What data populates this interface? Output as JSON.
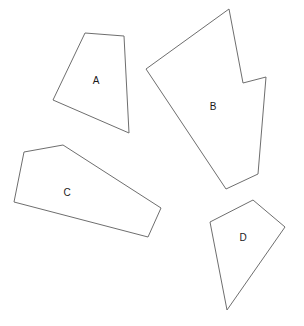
{
  "figure": {
    "kind": "polygon-diagram",
    "width": 304,
    "height": 326,
    "background_color": "#ffffff",
    "stroke_color": "#6e6e6e",
    "fill_color": "#ffffff",
    "label_color": "#1a1a1a",
    "stroke_width": 1
  },
  "chart_data": {
    "type": "table",
    "title": "",
    "xlabel": "",
    "ylabel": "",
    "shape_count": 4,
    "shapes": [
      {
        "label": "A",
        "vertex_count": 4,
        "kind": "quadrilateral",
        "convex": true,
        "points": "85,33 124,36 129,133 53,100",
        "label_x": 96,
        "label_y": 81
      },
      {
        "label": "B",
        "vertex_count": 6,
        "kind": "concave-hexagon",
        "convex": false,
        "points": "229,9 243,83 266,77 258,174 226,189 146,69",
        "label_x": 213,
        "label_y": 107
      },
      {
        "label": "C",
        "vertex_count": 5,
        "kind": "pentagon",
        "convex": true,
        "points": "24,152 63,145 161,208 148,237 14,202",
        "label_x": 67,
        "label_y": 193
      },
      {
        "label": "D",
        "vertex_count": 4,
        "kind": "quadrilateral",
        "convex": true,
        "points": "253,200 285,227 227,310 210,222",
        "label_x": 243,
        "label_y": 238
      }
    ]
  }
}
